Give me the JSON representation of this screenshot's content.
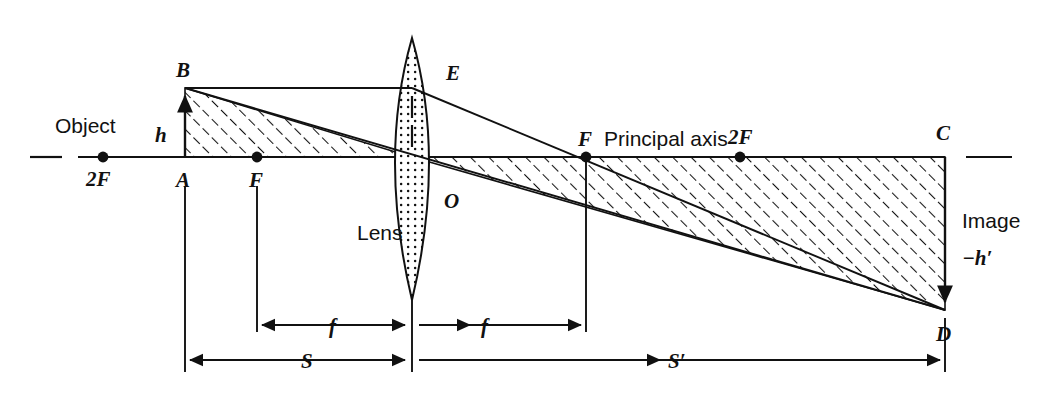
{
  "diagram": {
    "colors": {
      "ink": "#111111",
      "background": "#ffffff",
      "lens_fill": "#ffffff",
      "hatch": "#111111"
    },
    "labels": {
      "object": "Object",
      "object_height": "h",
      "point_a": "A",
      "point_b": "B",
      "point_c": "C",
      "point_d": "D",
      "point_e": "E",
      "point_o": "O",
      "focus_left": "F",
      "focus_right": "F",
      "double_focus_left": "2F",
      "double_focus_right": "2F",
      "lens": "Lens",
      "principal_axis": "Principal axis",
      "image": "Image",
      "image_height": "−h′"
    },
    "dimensions": {
      "focal_left": "f",
      "focal_right": "f",
      "object_distance": "S",
      "image_distance": "S′"
    },
    "geometry": {
      "axis_y": 157,
      "point_a_x": 185,
      "point_b_y": 88,
      "focus_left_x": 257,
      "double_focus_left_x": 103,
      "lens_center_x": 412,
      "focus_right_x": 586,
      "double_focus_right_x": 740,
      "point_c_x": 945,
      "point_d_y": 310,
      "lens_top_y": 38,
      "lens_bottom_y": 300
    }
  }
}
